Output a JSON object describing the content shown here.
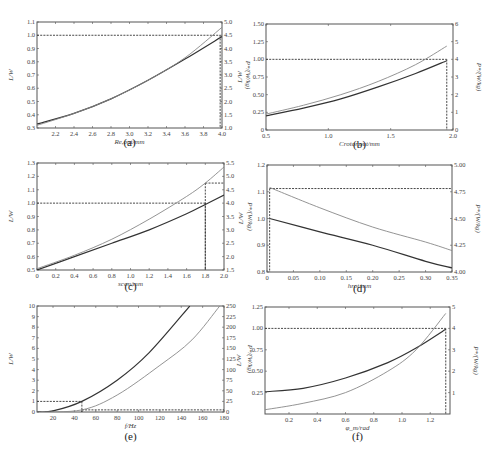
{
  "chart_data": [
    {
      "id": "a",
      "type": "line",
      "caption": "(a)",
      "xlabel": "R_{e,out}/mm",
      "ylabel_left": "L/W",
      "ylabel_right": "P*/(W/kg)",
      "xlim": [
        2.0,
        4.0
      ],
      "ylim_left": [
        0.3,
        1.1
      ],
      "ylim_right": [
        1.0,
        5.0
      ],
      "xticks": [
        "2.2",
        "2.4",
        "2.6",
        "2.8",
        "3.0",
        "3.2",
        "3.4",
        "3.6",
        "3.8",
        "4.0"
      ],
      "yticks_left": [
        "0.3",
        "0.4",
        "0.5",
        "0.6",
        "0.7",
        "0.8",
        "0.9",
        "1.0",
        "1.1"
      ],
      "yticks_right": [
        "1.0",
        "1.5",
        "2.0",
        "2.5",
        "3.0",
        "3.5",
        "4.0",
        "4.5",
        "5.0"
      ],
      "series": [
        {
          "name": "L (left axis)",
          "color": "#333333",
          "x": [
            2.0,
            2.4,
            2.8,
            3.2,
            3.6,
            4.0
          ],
          "y": [
            0.33,
            0.41,
            0.52,
            0.66,
            0.82,
            0.99
          ]
        },
        {
          "name": "P* (right axis)",
          "color": "#888888",
          "x": [
            2.0,
            2.4,
            2.8,
            3.2,
            3.6,
            4.0
          ],
          "y": [
            1.1,
            1.55,
            2.1,
            2.8,
            3.65,
            4.8
          ]
        }
      ],
      "reference": {
        "y_left": 1.0,
        "x": 3.98
      }
    },
    {
      "id": "b",
      "type": "line",
      "caption": "(b)",
      "xlabel": "C_{rotor,out}/mm",
      "ylabel_left": "L/W",
      "ylabel_right": "P*/(W/kg)",
      "xlim": [
        0.5,
        2.0
      ],
      "ylim_left": [
        0,
        1.5
      ],
      "ylim_right": [
        0,
        6
      ],
      "xticks": [
        "0.5",
        "1.0",
        "1.5",
        "2.0"
      ],
      "yticks_left": [
        "0",
        "0.25",
        "0.50",
        "0.75",
        "1.00",
        "1.25",
        "1.50"
      ],
      "yticks_right": [
        "0",
        "1",
        "2",
        "3",
        "4",
        "5",
        "6"
      ],
      "series": [
        {
          "name": "L (left axis)",
          "color": "#333333",
          "x": [
            0.5,
            0.8,
            1.1,
            1.4,
            1.7,
            1.95
          ],
          "y": [
            0.2,
            0.31,
            0.44,
            0.61,
            0.8,
            0.98
          ]
        },
        {
          "name": "P* (right axis)",
          "color": "#888888",
          "x": [
            0.5,
            0.8,
            1.1,
            1.4,
            1.7,
            1.95
          ],
          "y": [
            0.9,
            1.4,
            2.0,
            2.75,
            3.7,
            4.75
          ]
        }
      ],
      "reference": {
        "y_left": 1.0,
        "x": 1.95
      }
    },
    {
      "id": "c",
      "type": "line",
      "caption": "(c)",
      "xlabel": "s_{con}/mm",
      "ylabel_left": "L/W",
      "ylabel_right": "P*/(W/kg)",
      "xlim": [
        0,
        2.0
      ],
      "ylim_left": [
        0.5,
        1.3
      ],
      "ylim_right": [
        1.5,
        5.5
      ],
      "xticks": [
        "0",
        "0.2",
        "0.4",
        "0.6",
        "0.8",
        "1.0",
        "1.2",
        "1.4",
        "1.6",
        "1.8",
        "2.0"
      ],
      "yticks_left": [
        "0.5",
        "0.6",
        "0.7",
        "0.8",
        "0.9",
        "1.0",
        "1.1",
        "1.2",
        "1.3"
      ],
      "yticks_right": [
        "1.5",
        "2.0",
        "2.5",
        "3.0",
        "3.5",
        "4.0",
        "4.5",
        "5.0",
        "5.5"
      ],
      "series": [
        {
          "name": "L (left axis)",
          "color": "#333333",
          "x": [
            0,
            0.4,
            0.8,
            1.2,
            1.6,
            1.8,
            2.0
          ],
          "y": [
            0.5,
            0.6,
            0.7,
            0.8,
            0.92,
            0.99,
            1.06
          ]
        },
        {
          "name": "P* (right axis)",
          "color": "#888888",
          "x": [
            0,
            0.4,
            0.8,
            1.2,
            1.6,
            1.8,
            2.0
          ],
          "y": [
            1.55,
            2.05,
            2.65,
            3.4,
            4.25,
            4.75,
            5.35
          ]
        }
      ],
      "reference": {
        "y_left": 1.0,
        "x": 1.8,
        "y_right": 4.75
      }
    },
    {
      "id": "d",
      "type": "line",
      "caption": "(d)",
      "xlabel": "h_{rot}/mm",
      "ylabel_left": "L/W",
      "ylabel_right": "P*/(W/kg)",
      "xlim": [
        0,
        0.35
      ],
      "ylim_left": [
        0.8,
        1.2
      ],
      "ylim_right": [
        4.0,
        5.0
      ],
      "xticks": [
        "0",
        "0.05",
        "0.10",
        "0.15",
        "0.20",
        "0.25",
        "0.30",
        "0.35"
      ],
      "yticks_left": [
        "0.8",
        "0.9",
        "1.0",
        "1.1",
        "1.2"
      ],
      "yticks_right": [
        "4.00",
        "4.25",
        "4.50",
        "4.75",
        "5.00"
      ],
      "series": [
        {
          "name": "L (left axis)",
          "color": "#333333",
          "x": [
            0.005,
            0.1,
            0.2,
            0.3,
            0.35
          ],
          "y": [
            1.0,
            0.95,
            0.9,
            0.84,
            0.815
          ]
        },
        {
          "name": "P* (right axis)",
          "color": "#888888",
          "x": [
            0.005,
            0.1,
            0.2,
            0.3,
            0.35
          ],
          "y": [
            4.79,
            4.6,
            4.42,
            4.28,
            4.2
          ]
        }
      ],
      "reference": {
        "y_right": 4.78,
        "x": 0.005
      }
    },
    {
      "id": "e",
      "type": "line",
      "caption": "(e)",
      "xlabel": "f/Hz",
      "ylabel_left": "L/W",
      "ylabel_right": "P*/(W/kg)",
      "xlim": [
        5,
        180
      ],
      "ylim_left": [
        0,
        10
      ],
      "ylim_right": [
        0,
        250
      ],
      "xticks": [
        "20",
        "40",
        "60",
        "80",
        "100",
        "120",
        "140",
        "160",
        "180"
      ],
      "yticks_left": [
        "0",
        "1",
        "2",
        "3",
        "4",
        "5",
        "6",
        "7",
        "8",
        "9",
        "10"
      ],
      "yticks_right": [
        "0",
        "25",
        "50",
        "75",
        "100",
        "125",
        "150",
        "175",
        "200",
        "225",
        "250"
      ],
      "series": [
        {
          "name": "L (left axis)",
          "color": "#333333",
          "x": [
            5,
            20,
            47,
            80,
            110,
            148
          ],
          "y": [
            0.01,
            0.1,
            1.0,
            3.0,
            5.6,
            10.0
          ]
        },
        {
          "name": "P* (right axis)",
          "color": "#888888",
          "x": [
            5,
            47,
            80,
            120,
            150,
            176
          ],
          "y": [
            0,
            5,
            40,
            110,
            170,
            250
          ]
        }
      ],
      "reference": {
        "y_left": 1.0,
        "x": 47,
        "y_right": 5
      }
    },
    {
      "id": "f",
      "type": "line",
      "caption": "(f)",
      "xlabel": "φ_m/rad",
      "ylabel_left": "L/W",
      "ylabel_right": "P*/(W/kg)",
      "xlim": [
        0.03,
        1.34
      ],
      "ylim_left": [
        0,
        1.25
      ],
      "ylim_right": [
        0,
        5
      ],
      "xticks": [
        "0.2",
        "0.4",
        "0.6",
        "0.8",
        "1.0",
        "1.2"
      ],
      "yticks_left": [
        "0.25",
        "0.50",
        "0.75",
        "1.00",
        "1.25"
      ],
      "yticks_right": [
        "1",
        "2",
        "3",
        "4",
        "5"
      ],
      "series": [
        {
          "name": "L (left axis)",
          "color": "#333333",
          "x": [
            0.03,
            0.3,
            0.6,
            0.9,
            1.1,
            1.31
          ],
          "y": [
            0.26,
            0.3,
            0.42,
            0.6,
            0.77,
            0.99
          ]
        },
        {
          "name": "P* (right axis)",
          "color": "#888888",
          "x": [
            0.03,
            0.3,
            0.6,
            0.9,
            1.1,
            1.31
          ],
          "y": [
            0.2,
            0.5,
            1.0,
            2.0,
            3.0,
            4.7
          ]
        }
      ],
      "reference": {
        "y_left": 1.0,
        "x": 1.31
      }
    }
  ]
}
